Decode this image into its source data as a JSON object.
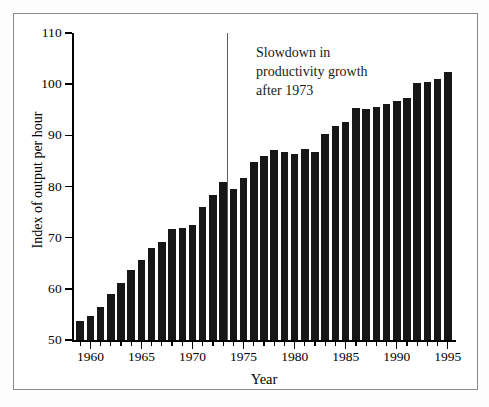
{
  "figure": {
    "annotation": "Slowdown in\nproductivity growth\nafter 1973",
    "reference_line_year": 1973
  },
  "chart_data": {
    "type": "bar",
    "title": "",
    "xlabel": "Year",
    "ylabel": "Index of output per hour",
    "xlim": [
      1958.2,
      1995.8
    ],
    "ylim": [
      50,
      110
    ],
    "ytick_labels": [
      "110",
      "100",
      "90",
      "80",
      "70",
      "60",
      "50"
    ],
    "yticks": [
      110,
      100,
      90,
      80,
      70,
      60,
      50
    ],
    "xtick_labels": [
      "1960",
      "1965",
      "1970",
      "1975",
      "1980",
      "1985",
      "1990",
      "1995"
    ],
    "xticks": [
      1960,
      1965,
      1970,
      1975,
      1980,
      1985,
      1990,
      1995
    ],
    "xtick_minor_step": 1,
    "grid": false,
    "legend": null,
    "bar_color": "#171717",
    "annotations": [
      {
        "text": "Slowdown in productivity growth after 1973",
        "x": 1976,
        "y": 104
      }
    ],
    "reference_lines": [
      {
        "orientation": "vertical",
        "x": 1973.4,
        "y_top": 110,
        "y_bottom": 50,
        "color": "#5d5d5d"
      }
    ],
    "categories": [
      1959,
      1960,
      1961,
      1962,
      1963,
      1964,
      1965,
      1966,
      1967,
      1968,
      1969,
      1970,
      1971,
      1972,
      1973,
      1974,
      1975,
      1976,
      1977,
      1978,
      1979,
      1980,
      1981,
      1982,
      1983,
      1984,
      1985,
      1986,
      1987,
      1988,
      1989,
      1990,
      1991,
      1992,
      1993,
      1994,
      1995
    ],
    "values": [
      53.8,
      54.7,
      56.4,
      59.0,
      61.1,
      63.6,
      65.6,
      68.0,
      69.2,
      71.7,
      71.8,
      72.5,
      75.9,
      78.4,
      80.9,
      79.6,
      81.7,
      84.7,
      86.0,
      87.2,
      86.8,
      86.4,
      87.3,
      86.8,
      90.2,
      91.9,
      92.7,
      95.3,
      95.1,
      95.6,
      96.2,
      96.7,
      97.3,
      100.2,
      100.5,
      101.0,
      102.3
    ]
  }
}
